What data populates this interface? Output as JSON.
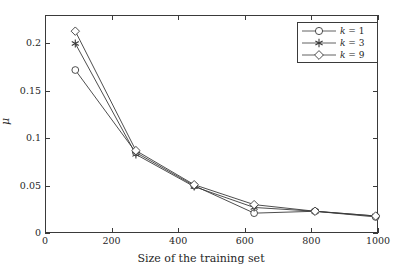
{
  "chart_data": {
    "type": "line",
    "title": "",
    "xlabel": "Size of the training set",
    "ylabel": "μ",
    "xlim": [
      0,
      1000
    ],
    "ylim": [
      0,
      0.23
    ],
    "xticks": [
      0,
      200,
      400,
      600,
      800,
      1000
    ],
    "xticklabels": [
      "0",
      "200",
      "400",
      "600",
      "800",
      "1000"
    ],
    "yticks": [
      0,
      0.05,
      0.1,
      0.15,
      0.2
    ],
    "yticklabels": [
      "0",
      "0.05",
      "0.1",
      "0.15",
      "0.2"
    ],
    "grid": false,
    "legend_position": "top-right",
    "x": [
      88,
      270,
      445,
      625,
      808,
      990
    ],
    "series": [
      {
        "name": "k = 1",
        "label_var": "k",
        "label_eq": "=",
        "label_val": "1",
        "marker": "circle",
        "color": "#3a3a3a",
        "values": [
          0.173,
          0.086,
          0.051,
          0.022,
          0.024,
          0.018
        ]
      },
      {
        "name": "k = 3",
        "label_var": "k",
        "label_eq": "=",
        "label_val": "3",
        "marker": "asterisk",
        "color": "#3a3a3a",
        "values": [
          0.201,
          0.084,
          0.05,
          0.028,
          0.024,
          0.019
        ]
      },
      {
        "name": "k = 9",
        "label_var": "k",
        "label_eq": "=",
        "label_val": "9",
        "marker": "diamond",
        "color": "#3a3a3a",
        "values": [
          0.214,
          0.088,
          0.052,
          0.031,
          0.024,
          0.019
        ]
      }
    ]
  }
}
